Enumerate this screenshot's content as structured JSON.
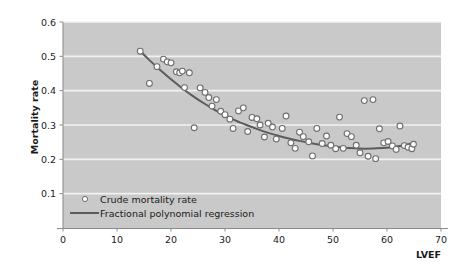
{
  "chart_data": {
    "type": "scatter",
    "title": "",
    "xlabel": "LVEF",
    "ylabel": "Mortality rate",
    "xlim": [
      0,
      70
    ],
    "ylim": [
      0.0,
      0.6
    ],
    "xticks": [
      0,
      10,
      20,
      30,
      40,
      50,
      60,
      70
    ],
    "xtick_labels": [
      "0",
      "10",
      "20",
      "30",
      "40",
      "50",
      "60",
      "70"
    ],
    "yticks": [
      0.1,
      0.2,
      0.3,
      0.4,
      0.5,
      0.6
    ],
    "ytick_labels": [
      "0.1",
      "0.2",
      "0.3",
      "0.4",
      "0.5",
      "0.6"
    ],
    "grid": "horizontal",
    "plot_background": "#c9c9c9",
    "figure_background": "#ffffff",
    "gridline_color": "#f2f2f2",
    "marker_face_color": "#ffffff",
    "marker_edge_color": "#6e6e6e",
    "line_color": "#5c5c5c",
    "legend_position": "bottom-left",
    "legend": [
      {
        "label": "Crude mortality rate",
        "marker": "open-circle"
      },
      {
        "label": "Fractional polynomial regression",
        "marker": "line"
      }
    ],
    "series": [
      {
        "name": "Crude mortality rate",
        "type": "scatter",
        "points": [
          [
            14.3,
            0.515
          ],
          [
            16.0,
            0.421
          ],
          [
            17.4,
            0.47
          ],
          [
            18.6,
            0.492
          ],
          [
            19.3,
            0.484
          ],
          [
            20.0,
            0.481
          ],
          [
            21.0,
            0.455
          ],
          [
            21.6,
            0.452
          ],
          [
            22.1,
            0.457
          ],
          [
            22.5,
            0.409
          ],
          [
            23.4,
            0.452
          ],
          [
            24.3,
            0.292
          ],
          [
            25.4,
            0.408
          ],
          [
            26.3,
            0.395
          ],
          [
            27.0,
            0.38
          ],
          [
            27.6,
            0.355
          ],
          [
            28.4,
            0.374
          ],
          [
            29.2,
            0.34
          ],
          [
            30.0,
            0.33
          ],
          [
            30.9,
            0.317
          ],
          [
            31.5,
            0.29
          ],
          [
            32.5,
            0.341
          ],
          [
            33.4,
            0.35
          ],
          [
            34.2,
            0.281
          ],
          [
            35.0,
            0.322
          ],
          [
            35.9,
            0.318
          ],
          [
            36.5,
            0.3
          ],
          [
            37.3,
            0.265
          ],
          [
            38.0,
            0.305
          ],
          [
            38.8,
            0.294
          ],
          [
            39.5,
            0.259
          ],
          [
            40.6,
            0.29
          ],
          [
            41.3,
            0.326
          ],
          [
            42.2,
            0.248
          ],
          [
            43.0,
            0.232
          ],
          [
            43.8,
            0.279
          ],
          [
            44.5,
            0.266
          ],
          [
            45.5,
            0.251
          ],
          [
            46.2,
            0.21
          ],
          [
            47.0,
            0.29
          ],
          [
            48.0,
            0.246
          ],
          [
            48.8,
            0.268
          ],
          [
            49.6,
            0.241
          ],
          [
            50.5,
            0.231
          ],
          [
            51.2,
            0.323
          ],
          [
            51.9,
            0.232
          ],
          [
            52.6,
            0.275
          ],
          [
            53.4,
            0.266
          ],
          [
            54.3,
            0.241
          ],
          [
            55.0,
            0.219
          ],
          [
            55.8,
            0.371
          ],
          [
            56.5,
            0.209
          ],
          [
            57.4,
            0.374
          ],
          [
            57.9,
            0.202
          ],
          [
            58.6,
            0.289
          ],
          [
            59.4,
            0.248
          ],
          [
            60.2,
            0.252
          ],
          [
            61.0,
            0.239
          ],
          [
            61.7,
            0.229
          ],
          [
            62.4,
            0.297
          ],
          [
            63.2,
            0.24
          ],
          [
            63.9,
            0.235
          ],
          [
            64.6,
            0.231
          ],
          [
            64.9,
            0.244
          ]
        ]
      },
      {
        "name": "Fractional polynomial regression",
        "type": "line",
        "points": [
          [
            14.5,
            0.512
          ],
          [
            16.0,
            0.489
          ],
          [
            18.0,
            0.46
          ],
          [
            20.0,
            0.433
          ],
          [
            22.0,
            0.408
          ],
          [
            24.0,
            0.385
          ],
          [
            26.0,
            0.364
          ],
          [
            28.0,
            0.345
          ],
          [
            30.0,
            0.328
          ],
          [
            32.0,
            0.313
          ],
          [
            34.0,
            0.3
          ],
          [
            36.0,
            0.288
          ],
          [
            38.0,
            0.277
          ],
          [
            40.0,
            0.268
          ],
          [
            42.0,
            0.26
          ],
          [
            44.0,
            0.253
          ],
          [
            46.0,
            0.247
          ],
          [
            48.0,
            0.242
          ],
          [
            50.0,
            0.238
          ],
          [
            52.0,
            0.234
          ],
          [
            54.0,
            0.232
          ],
          [
            56.0,
            0.231
          ],
          [
            58.0,
            0.232
          ],
          [
            60.0,
            0.234
          ],
          [
            62.0,
            0.238
          ],
          [
            63.5,
            0.242
          ],
          [
            65.0,
            0.247
          ]
        ]
      }
    ]
  }
}
